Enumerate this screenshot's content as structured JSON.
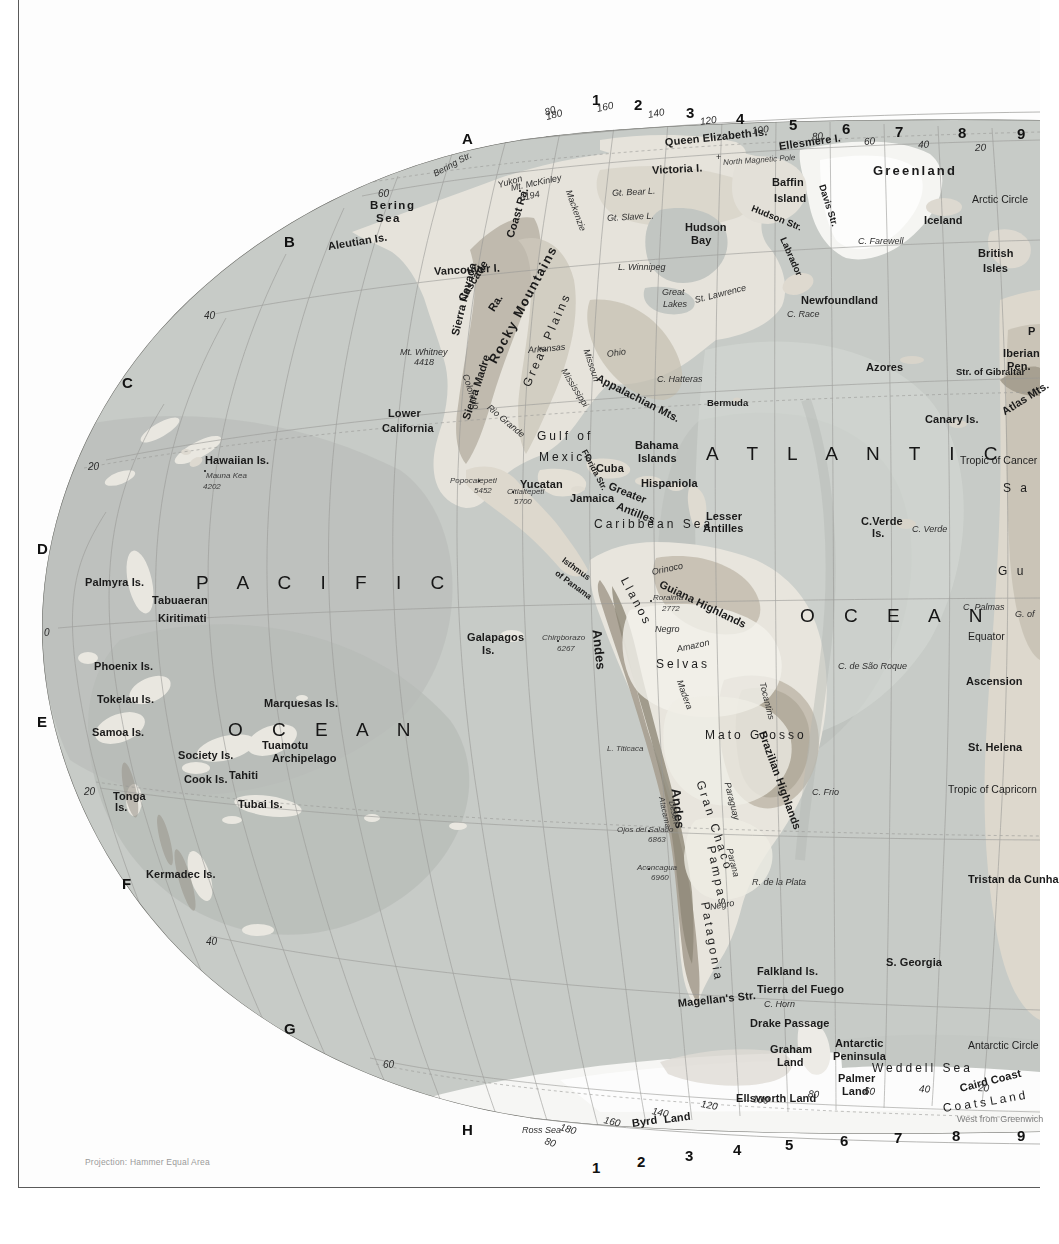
{
  "page": {
    "projection_note": "Projection: Hammer Equal Area",
    "greenwich_note": "West from Greenwich",
    "width": 1040,
    "height": 1244,
    "palette": {
      "ocean_shallow": "#d9dcd8",
      "ocean_mid": "#c3c7c3",
      "ocean_deep": "#b3b8b4",
      "land_low": "#efeee9",
      "land_mid": "#d8d5cc",
      "land_high": "#b9b3a6",
      "ice": "#f7f7f5",
      "graticule": "#9a9a96",
      "text": "#1a1a1a",
      "frame": "#5a5a5a"
    }
  },
  "index": {
    "letters": [
      {
        "label": "A",
        "x": 462,
        "y": 131
      },
      {
        "label": "B",
        "x": 284,
        "y": 234
      },
      {
        "label": "C",
        "x": 122,
        "y": 375
      },
      {
        "label": "D",
        "x": 37,
        "y": 541
      },
      {
        "label": "E",
        "x": 37,
        "y": 714
      },
      {
        "label": "F",
        "x": 122,
        "y": 876
      },
      {
        "label": "G",
        "x": 284,
        "y": 1021
      },
      {
        "label": "H",
        "x": 462,
        "y": 1122
      }
    ],
    "numbers_top": [
      {
        "label": "1",
        "x": 592,
        "y": 92
      },
      {
        "label": "2",
        "x": 634,
        "y": 97
      },
      {
        "label": "3",
        "x": 686,
        "y": 105
      },
      {
        "label": "4",
        "x": 736,
        "y": 111
      },
      {
        "label": "5",
        "x": 789,
        "y": 117
      },
      {
        "label": "6",
        "x": 842,
        "y": 121
      },
      {
        "label": "7",
        "x": 895,
        "y": 124
      },
      {
        "label": "8",
        "x": 958,
        "y": 125
      },
      {
        "label": "9",
        "x": 1017,
        "y": 126
      }
    ],
    "numbers_bottom": [
      {
        "label": "1",
        "x": 592,
        "y": 1160
      },
      {
        "label": "2",
        "x": 637,
        "y": 1154
      },
      {
        "label": "3",
        "x": 685,
        "y": 1148
      },
      {
        "label": "4",
        "x": 733,
        "y": 1142
      },
      {
        "label": "5",
        "x": 785,
        "y": 1137
      },
      {
        "label": "6",
        "x": 840,
        "y": 1133
      },
      {
        "label": "7",
        "x": 894,
        "y": 1130
      },
      {
        "label": "8",
        "x": 952,
        "y": 1128
      },
      {
        "label": "9",
        "x": 1017,
        "y": 1128
      }
    ]
  },
  "graticule_labels": [
    {
      "label": "180",
      "x": 546,
      "y": 112,
      "rot": -14
    },
    {
      "label": "160",
      "x": 597,
      "y": 104,
      "rot": -12
    },
    {
      "label": "140",
      "x": 648,
      "y": 110,
      "rot": -10
    },
    {
      "label": "120",
      "x": 700,
      "y": 117,
      "rot": -8
    },
    {
      "label": "100",
      "x": 752,
      "y": 126,
      "rot": -6
    },
    {
      "label": "80",
      "x": 812,
      "y": 132,
      "rot": -5
    },
    {
      "label": "60",
      "x": 864,
      "y": 137,
      "rot": -4
    },
    {
      "label": "40",
      "x": 918,
      "y": 140,
      "rot": -3
    },
    {
      "label": "20",
      "x": 975,
      "y": 143,
      "rot": -2
    },
    {
      "label": "80",
      "x": 545,
      "y": 108,
      "rot": -20
    },
    {
      "label": "60",
      "x": 378,
      "y": 189,
      "rot": 0
    },
    {
      "label": "40",
      "x": 204,
      "y": 311,
      "rot": 0
    },
    {
      "label": "20",
      "x": 88,
      "y": 462,
      "rot": 0
    },
    {
      "label": "0",
      "x": 44,
      "y": 628,
      "rot": 0
    },
    {
      "label": "20",
      "x": 84,
      "y": 787,
      "rot": 0
    },
    {
      "label": "40",
      "x": 206,
      "y": 937,
      "rot": 0
    },
    {
      "label": "60",
      "x": 383,
      "y": 1060,
      "rot": 0
    },
    {
      "label": "80",
      "x": 545,
      "y": 1136,
      "rot": 18
    },
    {
      "label": "180",
      "x": 560,
      "y": 1122,
      "rot": 16
    },
    {
      "label": "160",
      "x": 604,
      "y": 1115,
      "rot": 14
    },
    {
      "label": "140",
      "x": 652,
      "y": 1106,
      "rot": 12
    },
    {
      "label": "120",
      "x": 701,
      "y": 1099,
      "rot": 10
    },
    {
      "label": "100",
      "x": 752,
      "y": 1094,
      "rot": 7
    },
    {
      "label": "80",
      "x": 808,
      "y": 1089,
      "rot": 5
    },
    {
      "label": "60",
      "x": 864,
      "y": 1086,
      "rot": 4
    },
    {
      "label": "40",
      "x": 919,
      "y": 1084,
      "rot": 3
    },
    {
      "label": "20",
      "x": 978,
      "y": 1083,
      "rot": 2
    }
  ],
  "reference_lines": [
    {
      "label": "Arctic Circle",
      "x": 972,
      "y": 194
    },
    {
      "label": "Tropic of Cancer",
      "x": 960,
      "y": 455
    },
    {
      "label": "Equator",
      "x": 968,
      "y": 631
    },
    {
      "label": "Tropic of Capricorn",
      "x": 948,
      "y": 784
    },
    {
      "label": "Antarctic Circle",
      "x": 968,
      "y": 1040
    }
  ],
  "oceans": [
    {
      "label": "P A C I F I C",
      "x": 196,
      "y": 573,
      "cls": "l-ocean"
    },
    {
      "label": "O C E A N",
      "x": 228,
      "y": 720,
      "cls": "l-ocean"
    },
    {
      "label": "A T L A N T I C",
      "x": 706,
      "y": 444,
      "cls": "l-ocean"
    },
    {
      "label": "O C E A N",
      "x": 800,
      "y": 606,
      "cls": "l-ocean"
    }
  ],
  "seas": [
    {
      "label": "Caribbean Sea",
      "x": 594,
      "y": 518,
      "cls": "l-sea"
    },
    {
      "label": "Weddell Sea",
      "x": 872,
      "y": 1062,
      "cls": "l-sea"
    },
    {
      "label": "Bering",
      "x": 370,
      "y": 200,
      "cls": "l-sea-b"
    },
    {
      "label": "Sea",
      "x": 376,
      "y": 213,
      "cls": "l-sea-b"
    },
    {
      "label": "Gulf of",
      "x": 537,
      "y": 430,
      "cls": "l-sea"
    },
    {
      "label": "Mexico",
      "x": 539,
      "y": 451,
      "cls": "l-sea"
    },
    {
      "label": "S a",
      "x": 1003,
      "y": 482,
      "cls": "l-sea"
    }
  ],
  "labels_bold": [
    {
      "label": "Queen Elizabeth Is.",
      "x": 665,
      "y": 137,
      "rot": -6
    },
    {
      "label": "Ellesmere I.",
      "x": 779,
      "y": 141,
      "rot": -8
    },
    {
      "label": "Greenland",
      "x": 873,
      "y": 164,
      "size": 13,
      "spacing": 2.2
    },
    {
      "label": "Victoria I.",
      "x": 652,
      "y": 165,
      "rot": -3
    },
    {
      "label": "Baffin",
      "x": 772,
      "y": 177
    },
    {
      "label": "Island",
      "x": 774,
      "y": 193
    },
    {
      "label": "Iceland",
      "x": 924,
      "y": 215
    },
    {
      "label": "British",
      "x": 978,
      "y": 248
    },
    {
      "label": "Isles",
      "x": 983,
      "y": 263
    },
    {
      "label": "Aleutian Is.",
      "x": 328,
      "y": 241,
      "rot": -9
    },
    {
      "label": "Newfoundland",
      "x": 801,
      "y": 295
    },
    {
      "label": "Vancouver I.",
      "x": 434,
      "y": 266,
      "rot": -3
    },
    {
      "label": "Hawaiian Is.",
      "x": 205,
      "y": 455
    },
    {
      "label": "Lower",
      "x": 388,
      "y": 408
    },
    {
      "label": "California",
      "x": 382,
      "y": 423
    },
    {
      "label": "Yucatan",
      "x": 520,
      "y": 479
    },
    {
      "label": "Cuba",
      "x": 596,
      "y": 463
    },
    {
      "label": "Hispaniola",
      "x": 641,
      "y": 478
    },
    {
      "label": "Jamaica",
      "x": 570,
      "y": 493
    },
    {
      "label": "Bahama",
      "x": 635,
      "y": 440
    },
    {
      "label": "Islands",
      "x": 638,
      "y": 453
    },
    {
      "label": "Lesser",
      "x": 706,
      "y": 511
    },
    {
      "label": "Antilles",
      "x": 703,
      "y": 523
    },
    {
      "label": "Azores",
      "x": 866,
      "y": 362
    },
    {
      "label": "Canary Is.",
      "x": 925,
      "y": 414
    },
    {
      "label": "C.Verde",
      "x": 861,
      "y": 516
    },
    {
      "label": "Is.",
      "x": 872,
      "y": 528
    },
    {
      "label": "Iberian",
      "x": 1003,
      "y": 348
    },
    {
      "label": "Pen.",
      "x": 1007,
      "y": 361
    },
    {
      "label": "Palmyra Is.",
      "x": 85,
      "y": 577
    },
    {
      "label": "Tabuaeran",
      "x": 152,
      "y": 595
    },
    {
      "label": "Kiritimati",
      "x": 158,
      "y": 613
    },
    {
      "label": "Phoenix Is.",
      "x": 94,
      "y": 661
    },
    {
      "label": "Tokelau Is.",
      "x": 97,
      "y": 694
    },
    {
      "label": "Marquesas Is.",
      "x": 264,
      "y": 698
    },
    {
      "label": "Samoa Is.",
      "x": 92,
      "y": 727
    },
    {
      "label": "Society Is.",
      "x": 178,
      "y": 750
    },
    {
      "label": "Tuamotu",
      "x": 262,
      "y": 740
    },
    {
      "label": "Archipelago",
      "x": 272,
      "y": 753
    },
    {
      "label": "Tahiti",
      "x": 229,
      "y": 770
    },
    {
      "label": "Cook Is.",
      "x": 184,
      "y": 774
    },
    {
      "label": "Tonga",
      "x": 113,
      "y": 791
    },
    {
      "label": "Is.",
      "x": 115,
      "y": 802
    },
    {
      "label": "Tubai Is.",
      "x": 238,
      "y": 799
    },
    {
      "label": "Kermadec Is.",
      "x": 146,
      "y": 869
    },
    {
      "label": "Galapagos",
      "x": 467,
      "y": 632
    },
    {
      "label": "Is.",
      "x": 482,
      "y": 645
    },
    {
      "label": "Guiana Highlands",
      "x": 660,
      "y": 578,
      "rot": 26
    },
    {
      "label": "Brazilian Highlands",
      "x": 762,
      "y": 726,
      "rot": 70
    },
    {
      "label": "Mato Grosso",
      "x": 705,
      "y": 729,
      "cls": "l-sea"
    },
    {
      "label": "Falkland Is.",
      "x": 757,
      "y": 966
    },
    {
      "label": "Tierra del Fuego",
      "x": 757,
      "y": 984
    },
    {
      "label": "S. Georgia",
      "x": 886,
      "y": 957
    },
    {
      "label": "Magellan's Str.",
      "x": 678,
      "y": 998,
      "rot": -6
    },
    {
      "label": "Drake Passage",
      "x": 750,
      "y": 1018
    },
    {
      "label": "Graham",
      "x": 770,
      "y": 1044
    },
    {
      "label": "Land",
      "x": 777,
      "y": 1057
    },
    {
      "label": "Antarctic",
      "x": 835,
      "y": 1038
    },
    {
      "label": "Peninsula",
      "x": 833,
      "y": 1051
    },
    {
      "label": "Palmer",
      "x": 838,
      "y": 1073
    },
    {
      "label": "Land",
      "x": 842,
      "y": 1086
    },
    {
      "label": "Ellsworth Land",
      "x": 736,
      "y": 1093
    },
    {
      "label": "Byrd",
      "x": 632,
      "y": 1118,
      "rot": -8
    },
    {
      "label": "Land",
      "x": 664,
      "y": 1114,
      "rot": -7
    },
    {
      "label": "Ross Sea",
      "x": 522,
      "y": 1126,
      "cls": "l-ital"
    },
    {
      "label": "Ascension",
      "x": 966,
      "y": 676
    },
    {
      "label": "St. Helena",
      "x": 968,
      "y": 742
    },
    {
      "label": "Tristan da Cunha",
      "x": 968,
      "y": 874
    },
    {
      "label": "Coats",
      "x": 943,
      "y": 1102,
      "cls": "l-sea",
      "rot": -8
    },
    {
      "label": "Land",
      "x": 990,
      "y": 1095,
      "cls": "l-sea",
      "rot": -10
    },
    {
      "label": "Caird Coast",
      "x": 960,
      "y": 1083,
      "rot": -14
    },
    {
      "label": "G u",
      "x": 998,
      "y": 565,
      "cls": "l-sea"
    },
    {
      "label": "P",
      "x": 1028,
      "y": 326
    },
    {
      "label": "Rocky Mountains",
      "x": 492,
      "y": 356,
      "rot": -62,
      "size": 13,
      "spacing": 1.6
    },
    {
      "label": "Great Plains",
      "x": 526,
      "y": 380,
      "rot": -66,
      "cls": "l-sea"
    },
    {
      "label": "Appalachian Mts.",
      "x": 597,
      "y": 372,
      "rot": 27
    },
    {
      "label": "Cascade",
      "x": 461,
      "y": 295,
      "rot": -58
    },
    {
      "label": "Ra.",
      "x": 491,
      "y": 305,
      "rot": -58
    },
    {
      "label": "Coast Ra.",
      "x": 510,
      "y": 232,
      "rot": -73
    },
    {
      "label": "Sierra Nevada",
      "x": 455,
      "y": 330,
      "rot": -76
    },
    {
      "label": "Sierra Madre",
      "x": 466,
      "y": 414,
      "rot": -72
    },
    {
      "label": "Greater",
      "x": 609,
      "y": 480,
      "rot": 22
    },
    {
      "label": "Antilles",
      "x": 617,
      "y": 500,
      "rot": 22
    },
    {
      "label": "Isthmus",
      "x": 563,
      "y": 555,
      "rot": 36,
      "cls": "l-bold-xs"
    },
    {
      "label": "of Panama",
      "x": 556,
      "y": 568,
      "rot": 36,
      "cls": "l-bold-xs"
    },
    {
      "label": "Andes",
      "x": 597,
      "y": 623,
      "rot": 84,
      "size": 13
    },
    {
      "label": "Andes",
      "x": 676,
      "y": 782,
      "rot": 84,
      "size": 13
    },
    {
      "label": "Llanos",
      "x": 624,
      "y": 572,
      "rot": 62,
      "cls": "l-sea"
    },
    {
      "label": "Gran Chaco",
      "x": 700,
      "y": 775,
      "rot": 72,
      "cls": "l-sea"
    },
    {
      "label": "Pampas",
      "x": 711,
      "y": 840,
      "rot": 78,
      "cls": "l-sea"
    },
    {
      "label": "Patagonia",
      "x": 705,
      "y": 896,
      "rot": 80,
      "cls": "l-sea"
    },
    {
      "label": "Selvas",
      "x": 656,
      "y": 658,
      "cls": "l-sea"
    },
    {
      "label": "Atlas Mts.",
      "x": 1003,
      "y": 407,
      "rot": -32
    },
    {
      "label": "Str. of Gibraltar",
      "x": 956,
      "y": 367,
      "cls": "l-bold-s"
    },
    {
      "label": "Davis Str.",
      "x": 822,
      "y": 180,
      "rot": 72,
      "cls": "l-bold-s"
    },
    {
      "label": "Hudson Str.",
      "x": 752,
      "y": 203,
      "rot": 22,
      "cls": "l-bold-s"
    },
    {
      "label": "Labrador",
      "x": 783,
      "y": 233,
      "rot": 66,
      "cls": "l-bold-s"
    },
    {
      "label": "Hudson",
      "x": 685,
      "y": 222
    },
    {
      "label": "Bay",
      "x": 691,
      "y": 235
    },
    {
      "label": "Florida Str.",
      "x": 584,
      "y": 446,
      "rot": 62,
      "cls": "l-bold-xs"
    }
  ],
  "labels_italic": [
    {
      "label": "Bering Str.",
      "x": 434,
      "y": 170,
      "rot": -28
    },
    {
      "label": "Yukon",
      "x": 498,
      "y": 181,
      "rot": -16
    },
    {
      "label": "Mackenzie",
      "x": 568,
      "y": 186,
      "rot": 70
    },
    {
      "label": "Gt. Bear L.",
      "x": 612,
      "y": 189,
      "rot": -3
    },
    {
      "label": "Gt. Slave L.",
      "x": 607,
      "y": 214,
      "rot": -3
    },
    {
      "label": "North Magnetic Pole",
      "x": 723,
      "y": 159,
      "rot": -4,
      "cls": "l-ital-s"
    },
    {
      "label": "C. Farewell",
      "x": 858,
      "y": 237
    },
    {
      "label": "L. Winnipeg",
      "x": 618,
      "y": 263
    },
    {
      "label": "Great",
      "x": 662,
      "y": 288
    },
    {
      "label": "Lakes",
      "x": 663,
      "y": 300
    },
    {
      "label": "St. Lawrence",
      "x": 695,
      "y": 296,
      "rot": -14
    },
    {
      "label": "C. Race",
      "x": 787,
      "y": 310
    },
    {
      "label": "Mt. McKinley",
      "x": 511,
      "y": 184,
      "rot": -12
    },
    {
      "label": "6194",
      "x": 520,
      "y": 194,
      "rot": -12
    },
    {
      "label": "Mt. Whitney",
      "x": 400,
      "y": 348
    },
    {
      "label": "4418",
      "x": 414,
      "y": 358
    },
    {
      "label": "Colorado",
      "x": 465,
      "y": 370,
      "rot": 72
    },
    {
      "label": "Arkansas",
      "x": 528,
      "y": 346,
      "rot": -5
    },
    {
      "label": "Missouri",
      "x": 586,
      "y": 345,
      "rot": 72
    },
    {
      "label": "Ohio",
      "x": 607,
      "y": 350,
      "rot": -8
    },
    {
      "label": "Mississippi",
      "x": 563,
      "y": 365,
      "rot": 58
    },
    {
      "label": "Rio Grande",
      "x": 488,
      "y": 402,
      "rot": 40
    },
    {
      "label": "C. Hatteras",
      "x": 657,
      "y": 375
    },
    {
      "label": "Bermuda",
      "x": 707,
      "y": 398,
      "cls": "l-bold-s"
    },
    {
      "label": "Popocatepetl",
      "x": 450,
      "y": 477,
      "cls": "l-ital-s"
    },
    {
      "label": "5452",
      "x": 474,
      "y": 487,
      "cls": "l-ital-s"
    },
    {
      "label": "Citlaltepetl",
      "x": 507,
      "y": 488,
      "cls": "l-ital-s"
    },
    {
      "label": "5700",
      "x": 514,
      "y": 498,
      "cls": "l-ital-s"
    },
    {
      "label": "Mauna Kea",
      "x": 206,
      "y": 472,
      "cls": "l-ital-s"
    },
    {
      "label": "4202",
      "x": 203,
      "y": 483,
      "cls": "l-ital-s"
    },
    {
      "label": "Orinoco",
      "x": 652,
      "y": 568,
      "rot": -12
    },
    {
      "label": "Roraima",
      "x": 653,
      "y": 594,
      "cls": "l-ital-s"
    },
    {
      "label": "2772",
      "x": 662,
      "y": 605,
      "cls": "l-ital-s"
    },
    {
      "label": "Negro",
      "x": 655,
      "y": 625
    },
    {
      "label": "Amazon",
      "x": 677,
      "y": 645,
      "rot": -12
    },
    {
      "label": "Madera",
      "x": 679,
      "y": 676,
      "rot": 70
    },
    {
      "label": "Tocantins",
      "x": 762,
      "y": 678,
      "rot": 76
    },
    {
      "label": "Chimborazo",
      "x": 542,
      "y": 634,
      "cls": "l-ital-s"
    },
    {
      "label": "6267",
      "x": 557,
      "y": 645,
      "cls": "l-ital-s"
    },
    {
      "label": "L. Titicaca",
      "x": 607,
      "y": 745,
      "cls": "l-ital-s"
    },
    {
      "label": "Paraguay",
      "x": 727,
      "y": 778,
      "rot": 76
    },
    {
      "label": "Parana",
      "x": 729,
      "y": 844,
      "rot": 76
    },
    {
      "label": "Atacama",
      "x": 661,
      "y": 793,
      "rot": 78,
      "cls": "l-ital-s"
    },
    {
      "label": "Desert",
      "x": 671,
      "y": 797,
      "rot": 78,
      "cls": "l-ital-s"
    },
    {
      "label": "Ojos del Salado",
      "x": 617,
      "y": 826,
      "cls": "l-ital-s"
    },
    {
      "label": "6863",
      "x": 648,
      "y": 836,
      "cls": "l-ital-s"
    },
    {
      "label": "Aconcagua",
      "x": 637,
      "y": 864,
      "cls": "l-ital-s"
    },
    {
      "label": "6960",
      "x": 651,
      "y": 874,
      "cls": "l-ital-s"
    },
    {
      "label": "R. de la Plata",
      "x": 752,
      "y": 878
    },
    {
      "label": "Negro",
      "x": 710,
      "y": 903,
      "rot": -10
    },
    {
      "label": "C. Frio",
      "x": 812,
      "y": 788
    },
    {
      "label": "C. de São Roque",
      "x": 838,
      "y": 662
    },
    {
      "label": "C. Horn",
      "x": 764,
      "y": 1000
    },
    {
      "label": "C. Palmas",
      "x": 963,
      "y": 603
    },
    {
      "label": "C. Verde",
      "x": 912,
      "y": 525
    },
    {
      "label": "G. of",
      "x": 1015,
      "y": 610
    }
  ]
}
